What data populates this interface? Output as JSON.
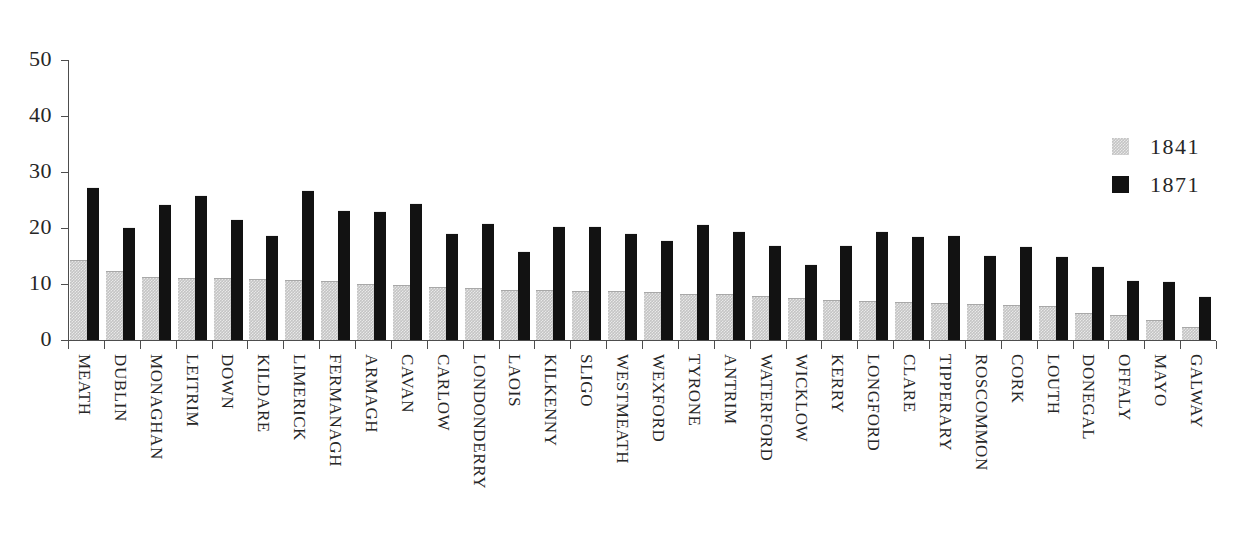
{
  "chart_data": {
    "type": "bar",
    "title": "",
    "subtitle": "",
    "xlabel": "",
    "ylabel": "",
    "ylim": [
      0,
      50
    ],
    "yticks": [
      0,
      10,
      20,
      30,
      40,
      50
    ],
    "grid": false,
    "legend_position": "right",
    "orientation": "vertical",
    "categories": [
      "MEATH",
      "DUBLIN",
      "MONAGHAN",
      "LEITRIM",
      "DOWN",
      "KILDARE",
      "LIMERICK",
      "FERMANAGH",
      "ARMAGH",
      "CAVAN",
      "CARLOW",
      "LONDONDERRY",
      "LAOIS",
      "KILKENNY",
      "SLIGO",
      "WESTMEATH",
      "WEXFORD",
      "TYRONE",
      "ANTRIM",
      "WATERFORD",
      "WICKLOW",
      "KERRY",
      "LONGFORD",
      "CLARE",
      "TIPPERARY",
      "ROSCOMMON",
      "CORK",
      "LOUTH",
      "DONEGAL",
      "OFFALY",
      "MAYO",
      "GALWAY"
    ],
    "series": [
      {
        "name": "1841",
        "color": "#c4c4c4",
        "values": [
          14.3,
          12.4,
          11.3,
          11.1,
          11.1,
          10.9,
          10.7,
          10.5,
          10.0,
          9.9,
          9.5,
          9.2,
          9.0,
          8.9,
          8.8,
          8.7,
          8.6,
          8.3,
          8.2,
          7.9,
          7.5,
          7.1,
          6.9,
          6.8,
          6.6,
          6.4,
          6.2,
          6.0,
          4.9,
          4.4,
          3.5,
          2.3
        ]
      },
      {
        "name": "1871",
        "color": "#121212",
        "values": [
          27.3,
          20.1,
          24.2,
          25.9,
          21.6,
          18.8,
          26.8,
          23.2,
          23.0,
          24.4,
          19.1,
          20.9,
          15.9,
          20.4,
          20.4,
          19.1,
          17.9,
          20.8,
          19.4,
          17.0,
          13.5,
          17.0,
          19.4,
          18.5,
          18.7,
          15.2,
          16.7,
          15.0,
          13.2,
          10.8,
          10.6,
          7.8
        ]
      }
    ]
  },
  "legend": {
    "entries": [
      {
        "label": "1841",
        "swatch": "gray-swatch"
      },
      {
        "label": "1871",
        "swatch": "black-swatch"
      }
    ]
  },
  "y_axis": {
    "tick_labels": [
      "50",
      "40",
      "30",
      "20",
      "10",
      "0"
    ]
  }
}
